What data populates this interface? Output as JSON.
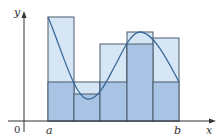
{
  "figure": {
    "type": "riemann-sum-diagram",
    "labels": {
      "y_axis": "y",
      "x_axis": "x",
      "origin": "0",
      "a": "a",
      "b": "b"
    },
    "colors": {
      "upper_fill": "#d6e6f5",
      "lower_fill": "#a9c3e4",
      "rect_stroke": "#4a5a6a",
      "curve": "#3a6a9a",
      "axis": "#333333"
    },
    "partition_count": 5,
    "rectangles": [
      {
        "x0": 48,
        "x1": 74,
        "upper_top": 17,
        "lower_top": 82
      },
      {
        "x0": 74,
        "x1": 100,
        "upper_top": 82,
        "lower_top": 94
      },
      {
        "x0": 100,
        "x1": 127,
        "upper_top": 44,
        "lower_top": 82
      },
      {
        "x0": 127,
        "x1": 153,
        "upper_top": 32,
        "lower_top": 44
      },
      {
        "x0": 153,
        "x1": 179,
        "upper_top": 38,
        "lower_top": 82
      }
    ]
  }
}
